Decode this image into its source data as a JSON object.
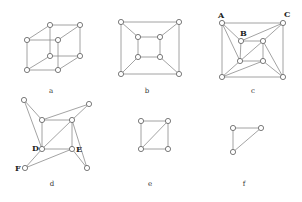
{
  "figure": {
    "background": "#ffffff",
    "edge_color": "#8c8c8c",
    "node_fill": "#ffffff",
    "node_stroke": "#5a5a5a",
    "node_radius": 2.6,
    "panels": [
      {
        "id": "a",
        "caption": "a",
        "caption_pos": [
          51,
          93
        ],
        "nodes": [
          [
            27,
            40
          ],
          [
            58,
            40
          ],
          [
            27,
            70
          ],
          [
            58,
            70
          ],
          [
            50,
            25
          ],
          [
            80,
            25
          ],
          [
            50,
            56
          ],
          [
            80,
            56
          ]
        ],
        "edges": [
          [
            0,
            1
          ],
          [
            1,
            3
          ],
          [
            3,
            2
          ],
          [
            2,
            0
          ],
          [
            4,
            5
          ],
          [
            5,
            7
          ],
          [
            7,
            6
          ],
          [
            6,
            4
          ],
          [
            0,
            4
          ],
          [
            1,
            5
          ],
          [
            2,
            6
          ],
          [
            3,
            7
          ]
        ],
        "labels": []
      },
      {
        "id": "b",
        "caption": "b",
        "caption_pos": [
          147,
          93
        ],
        "nodes": [
          [
            121,
            22
          ],
          [
            179,
            22
          ],
          [
            121,
            74
          ],
          [
            179,
            74
          ],
          [
            138,
            37
          ],
          [
            160,
            37
          ],
          [
            138,
            57
          ],
          [
            160,
            57
          ]
        ],
        "edges": [
          [
            0,
            1
          ],
          [
            1,
            3
          ],
          [
            3,
            2
          ],
          [
            2,
            0
          ],
          [
            4,
            5
          ],
          [
            5,
            7
          ],
          [
            7,
            6
          ],
          [
            6,
            4
          ],
          [
            0,
            4
          ],
          [
            1,
            5
          ],
          [
            2,
            6
          ],
          [
            3,
            7
          ]
        ],
        "labels": []
      },
      {
        "id": "c",
        "caption": "c",
        "caption_pos": [
          253,
          93
        ],
        "nodes": [
          [
            222,
            23
          ],
          [
            283,
            23
          ],
          [
            241,
            41
          ],
          [
            263,
            41
          ],
          [
            240,
            61
          ],
          [
            263,
            61
          ],
          [
            222,
            77
          ],
          [
            283,
            77
          ]
        ],
        "edges": [
          [
            0,
            1
          ],
          [
            1,
            7
          ],
          [
            7,
            6
          ],
          [
            6,
            0
          ],
          [
            2,
            3
          ],
          [
            3,
            5
          ],
          [
            5,
            4
          ],
          [
            4,
            2
          ],
          [
            0,
            2
          ],
          [
            0,
            4
          ],
          [
            1,
            3
          ],
          [
            1,
            2
          ],
          [
            3,
            4
          ],
          [
            4,
            6
          ],
          [
            5,
            6
          ],
          [
            3,
            7
          ],
          [
            5,
            7
          ]
        ],
        "labels": [
          {
            "text": "A",
            "pos": [
              218,
              18
            ]
          },
          {
            "text": "C",
            "pos": [
              284,
              17
            ]
          },
          {
            "text": "B",
            "pos": [
              240,
              36
            ]
          }
        ]
      },
      {
        "id": "d",
        "caption": "d",
        "caption_pos": [
          52,
          186
        ],
        "nodes": [
          [
            24,
            100
          ],
          [
            89,
            104
          ],
          [
            42,
            120
          ],
          [
            72,
            120
          ],
          [
            42,
            149
          ],
          [
            72,
            149
          ],
          [
            25,
            168
          ],
          [
            87,
            168
          ]
        ],
        "edges": [
          [
            2,
            3
          ],
          [
            3,
            5
          ],
          [
            5,
            4
          ],
          [
            4,
            2
          ],
          [
            4,
            3
          ],
          [
            0,
            2
          ],
          [
            0,
            4
          ],
          [
            1,
            2
          ],
          [
            1,
            3
          ],
          [
            6,
            4
          ],
          [
            6,
            5
          ],
          [
            7,
            5
          ],
          [
            7,
            3
          ]
        ],
        "labels": [
          {
            "text": "D",
            "pos": [
              32,
              151
            ]
          },
          {
            "text": "E",
            "pos": [
              76,
              152
            ]
          },
          {
            "text": "F",
            "pos": [
              15,
              171
            ]
          }
        ]
      },
      {
        "id": "e",
        "caption": "e",
        "caption_pos": [
          150,
          186
        ],
        "nodes": [
          [
            141,
            121
          ],
          [
            168,
            121
          ],
          [
            141,
            149
          ],
          [
            168,
            149
          ]
        ],
        "edges": [
          [
            0,
            1
          ],
          [
            1,
            3
          ],
          [
            3,
            2
          ],
          [
            2,
            0
          ],
          [
            2,
            1
          ]
        ],
        "labels": []
      },
      {
        "id": "f",
        "caption": "f",
        "caption_pos": [
          244,
          186
        ],
        "nodes": [
          [
            233,
            128
          ],
          [
            261,
            128
          ],
          [
            233,
            152
          ]
        ],
        "edges": [
          [
            0,
            1
          ],
          [
            0,
            2
          ],
          [
            2,
            1
          ]
        ],
        "labels": []
      }
    ]
  }
}
